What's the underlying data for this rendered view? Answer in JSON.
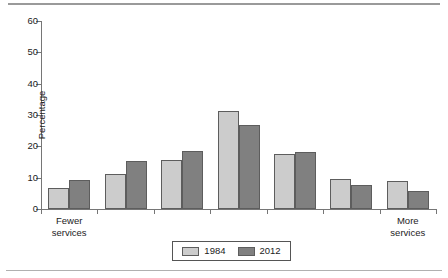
{
  "chart_data": {
    "type": "bar",
    "title": "",
    "subtitle": "",
    "xlabel": "",
    "ylabel": "Percentage",
    "ylim": [
      0,
      60
    ],
    "yticks": [
      0,
      10,
      20,
      30,
      40,
      50,
      60
    ],
    "ytick_labels": [
      "0",
      "10",
      "20",
      "30",
      "40",
      "50",
      "60"
    ],
    "grid": false,
    "legend_position": "bottom-center",
    "categories": [
      "1",
      "2",
      "3",
      "4",
      "5",
      "6",
      "7"
    ],
    "category_labels": [
      {
        "line1": "Fewer",
        "line2": "services"
      },
      {
        "line1": "",
        "line2": ""
      },
      {
        "line1": "",
        "line2": ""
      },
      {
        "line1": "",
        "line2": ""
      },
      {
        "line1": "",
        "line2": ""
      },
      {
        "line1": "",
        "line2": ""
      },
      {
        "line1": "More",
        "line2": "services"
      }
    ],
    "axis_end_labels": {
      "left_line1": "Fewer",
      "left_line2": "services",
      "right_line1": "More",
      "right_line2": "services"
    },
    "series": [
      {
        "name": "1984",
        "color": "#cccccc",
        "values": [
          6.7,
          11.3,
          15.6,
          31.4,
          17.4,
          9.5,
          9.0
        ]
      },
      {
        "name": "2012",
        "color": "#808080",
        "values": [
          9.3,
          15.2,
          18.4,
          26.7,
          18.2,
          7.6,
          5.9
        ]
      }
    ]
  },
  "legend": {
    "entries": [
      {
        "label": "1984"
      },
      {
        "label": "2012"
      }
    ]
  },
  "colors": {
    "series_1984": "#cccccc",
    "series_2012": "#808080",
    "axis": "#767676",
    "bar_outline": "#5d5d5d",
    "rule": "#9a9a9a",
    "background": "#ffffff"
  }
}
